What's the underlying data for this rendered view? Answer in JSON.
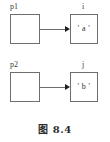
{
  "figure": {
    "caption": "图 8.4",
    "rows": [
      {
        "pointer_label": "p1",
        "pointer_value": "",
        "target_label": "i",
        "target_value": "' a '"
      },
      {
        "pointer_label": "p2",
        "pointer_value": "",
        "target_label": "j",
        "target_value": "' b '"
      }
    ],
    "colors": {
      "box_border": "#6e6e6e",
      "arrow": "#6e6e6e",
      "arrow_head": "#1e1e1e",
      "text": "#2b2b2b",
      "background": "#ffffff"
    }
  }
}
